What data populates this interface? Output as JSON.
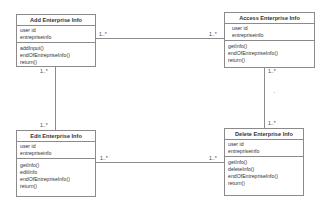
{
  "diagram": {
    "type": "UML class diagram",
    "classes": [
      {
        "id": "add",
        "name": "Add Enterprise Info",
        "attributes": [
          "user id",
          "entrepriseinfo"
        ],
        "operations": [
          "addInput()",
          "endOfEntrepriseInfo()",
          "return()"
        ]
      },
      {
        "id": "access",
        "name": "Access Enterprise Info",
        "attributes": [
          "user id",
          "entrepriseinfo"
        ],
        "operations": [
          "getInfo()",
          "endOfEntrepriseInfo()",
          "return()"
        ]
      },
      {
        "id": "edit",
        "name": "Edit Enterprise Info",
        "attributes": [
          "user id",
          "entrepriseinfo"
        ],
        "operations": [
          "getInfo()",
          "editInfo",
          "endOfEntrepriseInfo()",
          "return()"
        ]
      },
      {
        "id": "delete",
        "name": "Delete Enterprise Info",
        "attributes": [
          "user id",
          "entrepriseinfo"
        ],
        "operations": [
          "getInfo()",
          "deleteInfo()",
          "endOfEntrepriseInfo()",
          "return()"
        ]
      }
    ],
    "associations": [
      {
        "from": "add",
        "to": "access",
        "from_mult": "1..*",
        "to_mult": "1..*"
      },
      {
        "from": "add",
        "to": "edit",
        "from_mult": "1..*",
        "to_mult": "1..*"
      },
      {
        "from": "access",
        "to": "delete",
        "from_mult": "1..*",
        "to_mult": "1..*"
      },
      {
        "from": "edit",
        "to": "delete",
        "from_mult": "1..*",
        "to_mult": "1..*"
      }
    ]
  }
}
